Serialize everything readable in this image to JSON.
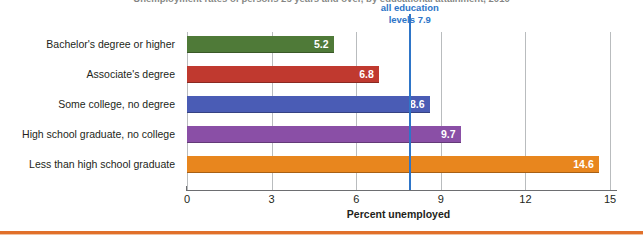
{
  "chart_data": {
    "type": "bar",
    "orientation": "horizontal",
    "title": "Unemployment rates of persons 25 years and over, by educational attainment, 2010",
    "xlabel": "Percent unemployed",
    "ylabel": "",
    "xlim": [
      0,
      15
    ],
    "grid": true,
    "legend_position": "none",
    "categories": [
      "Bachelor's degree or higher",
      "Associate's degree",
      "Some college, no degree",
      "High school graduate, no college",
      "Less than high school graduate"
    ],
    "values": [
      5.2,
      6.8,
      8.6,
      9.7,
      14.6
    ],
    "value_labels": [
      "5.2",
      "6.8",
      "8.6",
      "9.7",
      "14.6"
    ],
    "bar_colors": [
      "#4f7a38",
      "#c0392f",
      "#4a5cb5",
      "#8a4fa6",
      "#e8861e"
    ],
    "xticks": [
      0,
      3,
      6,
      9,
      12,
      15
    ],
    "xtick_labels": [
      "0",
      "3",
      "6",
      "9",
      "12",
      "15"
    ],
    "annotations": [
      {
        "name": "all-education-levels-reference",
        "text_line1": "all education",
        "text_line2": "levels 7.9",
        "value": 7.9,
        "color": "#2e75c8"
      }
    ],
    "accent_color": "#e1702a"
  }
}
